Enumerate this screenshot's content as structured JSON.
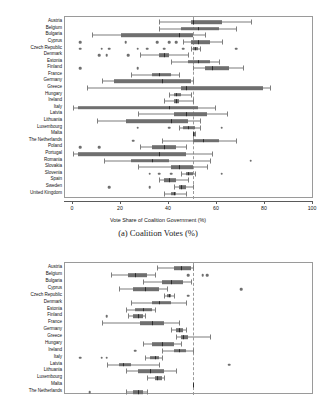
{
  "figure": {
    "top_partial_text": "",
    "panels": [
      {
        "id": "panel-a",
        "caption": "(a) Coalition Votes (%)",
        "xlabel": "Vote Share of Coalition Government (%)",
        "reference_line": 50
      },
      {
        "id": "panel-b",
        "caption": "",
        "xlabel": "",
        "reference_line": 50
      }
    ]
  },
  "chart_data": [
    {
      "type": "box",
      "id": "panel-a",
      "title": "(a) Coalition Votes (%)",
      "xlabel": "Vote Share of Coalition Government (%)",
      "ylabel": "",
      "xlim": [
        0,
        100
      ],
      "xticks": [
        0,
        20,
        40,
        60,
        80,
        100
      ],
      "xticklabels": [
        "0",
        "20",
        "40",
        "60",
        "80",
        "100"
      ],
      "grid": false,
      "legend": "none",
      "reference_line": 50,
      "categories": [
        "Austria",
        "Belgium",
        "Bulgaria",
        "Cyprus",
        "Czech Republic",
        "Denmark",
        "Estonia",
        "Finland",
        "France",
        "Germany",
        "Greece",
        "Hungary",
        "Ireland",
        "Italy",
        "Latvia",
        "Lithuania",
        "Luxembourg",
        "Malta",
        "The Netherlands",
        "Poland",
        "Portugal",
        "Romania",
        "Slovakia",
        "Slovenia",
        "Spain",
        "Sweden",
        "United Kingdom"
      ],
      "boxes": [
        {
          "category": "Austria",
          "whisker_low": 36,
          "q1": 49,
          "median": 50,
          "q3": 62,
          "whisker_high": 74,
          "outliers": []
        },
        {
          "category": "Belgium",
          "whisker_low": 36,
          "q1": 45,
          "median": 52,
          "q3": 61,
          "whisker_high": 68,
          "outliers": []
        },
        {
          "category": "Bulgaria",
          "whisker_low": 8,
          "q1": 20,
          "median": 44,
          "q3": 50,
          "whisker_high": 55,
          "outliers": []
        },
        {
          "category": "Cyprus",
          "whisker_low": 46,
          "q1": 49,
          "median": 52,
          "q3": 57,
          "whisker_high": 62,
          "outliers": [
            3,
            22,
            35,
            40,
            43
          ]
        },
        {
          "category": "Czech Republic",
          "whisker_low": 49,
          "q1": 50,
          "median": 51,
          "q3": 52,
          "whisker_high": 53,
          "outliers": [
            3,
            12,
            15,
            27,
            31,
            38,
            46,
            68
          ]
        },
        {
          "category": "Denmark",
          "whisker_low": 28,
          "q1": 36,
          "median": 38,
          "q3": 40,
          "whisker_high": 48,
          "outliers": [
            11,
            14,
            23
          ]
        },
        {
          "category": "Estonia",
          "whisker_low": 41,
          "q1": 48,
          "median": 52,
          "q3": 57,
          "whisker_high": 61,
          "outliers": []
        },
        {
          "category": "Finland",
          "whisker_low": 50,
          "q1": 55,
          "median": 58,
          "q3": 65,
          "whisker_high": 71,
          "outliers": [
            3,
            27
          ]
        },
        {
          "category": "France",
          "whisker_low": 24,
          "q1": 33,
          "median": 36,
          "q3": 41,
          "whisker_high": 44,
          "outliers": []
        },
        {
          "category": "Germany",
          "whisker_low": 12,
          "q1": 17,
          "median": 37,
          "q3": 49,
          "whisker_high": 50,
          "outliers": []
        },
        {
          "category": "Greece",
          "whisker_low": 6,
          "q1": 45,
          "median": 47,
          "q3": 79,
          "whisker_high": 82,
          "outliers": []
        },
        {
          "category": "Hungary",
          "whisker_low": 40,
          "q1": 42,
          "median": 43,
          "q3": 45,
          "whisker_high": 49,
          "outliers": []
        },
        {
          "category": "Ireland",
          "whisker_low": 38,
          "q1": 42,
          "median": 43,
          "q3": 44,
          "whisker_high": 50,
          "outliers": []
        },
        {
          "category": "Italy",
          "whisker_low": 0,
          "q1": 2,
          "median": 40,
          "q3": 52,
          "whisker_high": 59,
          "outliers": []
        },
        {
          "category": "Latvia",
          "whisker_low": 27,
          "q1": 42,
          "median": 47,
          "q3": 56,
          "whisker_high": 64,
          "outliers": []
        },
        {
          "category": "Lithuania",
          "whisker_low": 10,
          "q1": 22,
          "median": 41,
          "q3": 48,
          "whisker_high": 53,
          "outliers": []
        },
        {
          "category": "Luxembourg",
          "whisker_low": 44,
          "q1": 46,
          "median": 48,
          "q3": 51,
          "whisker_high": 53,
          "outliers": [
            27,
            40,
            62
          ]
        },
        {
          "category": "Malta",
          "whisker_low": 50,
          "q1": 50,
          "median": 50,
          "q3": 51,
          "whisker_high": 51,
          "outliers": []
        },
        {
          "category": "The Netherlands",
          "whisker_low": 37,
          "q1": 50,
          "median": 54,
          "q3": 61,
          "whisker_high": 68,
          "outliers": [
            25
          ]
        },
        {
          "category": "Poland",
          "whisker_low": 28,
          "q1": 33,
          "median": 38,
          "q3": 43,
          "whisker_high": 47,
          "outliers": [
            3,
            11
          ]
        },
        {
          "category": "Portugal",
          "whisker_low": 0,
          "q1": 2,
          "median": 36,
          "q3": 47,
          "whisker_high": 58,
          "outliers": []
        },
        {
          "category": "Romania",
          "whisker_low": 13,
          "q1": 24,
          "median": 33,
          "q3": 40,
          "whisker_high": 57,
          "outliers": [
            74
          ]
        },
        {
          "category": "Slovakia",
          "whisker_low": 27,
          "q1": 41,
          "median": 44,
          "q3": 50,
          "whisker_high": 56,
          "outliers": []
        },
        {
          "category": "Slovenia",
          "whisker_low": 45,
          "q1": 47,
          "median": 48,
          "q3": 50,
          "whisker_high": 51,
          "outliers": [
            32,
            36,
            41,
            62
          ]
        },
        {
          "category": "Spain",
          "whisker_low": 36,
          "q1": 38,
          "median": 40,
          "q3": 43,
          "whisker_high": 48,
          "outliers": []
        },
        {
          "category": "Sweden",
          "whisker_low": 42,
          "q1": 44,
          "median": 45,
          "q3": 47,
          "whisker_high": 50,
          "outliers": [
            15,
            32
          ]
        },
        {
          "category": "United Kingdom",
          "whisker_low": 38,
          "q1": 41,
          "median": 42,
          "q3": 43,
          "whisker_high": 47,
          "outliers": []
        }
      ]
    },
    {
      "type": "box",
      "id": "panel-b",
      "title": "",
      "xlabel": "",
      "ylabel": "",
      "xlim": [
        0,
        100
      ],
      "xticks": [
        0,
        20,
        40,
        60,
        80,
        100
      ],
      "xticklabels": [
        "0",
        "20",
        "40",
        "60",
        "80",
        "100"
      ],
      "grid": false,
      "legend": "none",
      "reference_line": 50,
      "note": "Panel is cropped at the bottom edge of the screenshot; only rows Austria through The Netherlands are visible.",
      "categories": [
        "Austria",
        "Belgium",
        "Bulgaria",
        "Cyprus",
        "Czech Republic",
        "Denmark",
        "Estonia",
        "Finland",
        "France",
        "Germany",
        "Greece",
        "Hungary",
        "Ireland",
        "Italy",
        "Latvia",
        "Lithuania",
        "Luxembourg",
        "Malta",
        "The Netherlands"
      ],
      "boxes": [
        {
          "category": "Austria",
          "whisker_low": 35,
          "q1": 42,
          "median": 45,
          "q3": 49,
          "whisker_high": 50,
          "outliers": []
        },
        {
          "category": "Belgium",
          "whisker_low": 16,
          "q1": 23,
          "median": 26,
          "q3": 31,
          "whisker_high": 34,
          "outliers": [
            48,
            54,
            56
          ]
        },
        {
          "category": "Bulgaria",
          "whisker_low": 29,
          "q1": 37,
          "median": 41,
          "q3": 46,
          "whisker_high": 49,
          "outliers": []
        },
        {
          "category": "Cyprus",
          "whisker_low": 19,
          "q1": 25,
          "median": 30,
          "q3": 36,
          "whisker_high": 39,
          "outliers": [
            70
          ]
        },
        {
          "category": "Czech Republic",
          "whisker_low": 38,
          "q1": 39,
          "median": 40,
          "q3": 41,
          "whisker_high": 42,
          "outliers": [
            48
          ]
        },
        {
          "category": "Denmark",
          "whisker_low": 24,
          "q1": 33,
          "median": 36,
          "q3": 41,
          "whisker_high": 47,
          "outliers": []
        },
        {
          "category": "Estonia",
          "whisker_low": 22,
          "q1": 26,
          "median": 29,
          "q3": 33,
          "whisker_high": 34,
          "outliers": []
        },
        {
          "category": "Finland",
          "whisker_low": 23,
          "q1": 25,
          "median": 27,
          "q3": 29,
          "whisker_high": 30,
          "outliers": [
            14
          ]
        },
        {
          "category": "France",
          "whisker_low": 12,
          "q1": 28,
          "median": 33,
          "q3": 38,
          "whisker_high": 44,
          "outliers": []
        },
        {
          "category": "Germany",
          "whisker_low": 41,
          "q1": 43,
          "median": 44,
          "q3": 46,
          "whisker_high": 47,
          "outliers": []
        },
        {
          "category": "Greece",
          "whisker_low": 43,
          "q1": 45,
          "median": 46,
          "q3": 48,
          "whisker_high": 57,
          "outliers": []
        },
        {
          "category": "Hungary",
          "whisker_low": 29,
          "q1": 33,
          "median": 37,
          "q3": 42,
          "whisker_high": 45,
          "outliers": []
        },
        {
          "category": "Ireland",
          "whisker_low": 37,
          "q1": 42,
          "median": 44,
          "q3": 47,
          "whisker_high": 50,
          "outliers": [
            26
          ]
        },
        {
          "category": "Italy",
          "whisker_low": 30,
          "q1": 32,
          "median": 34,
          "q3": 36,
          "whisker_high": 37,
          "outliers": [
            3,
            12,
            14
          ]
        },
        {
          "category": "Latvia",
          "whisker_low": 14,
          "q1": 19,
          "median": 21,
          "q3": 24,
          "whisker_high": 36,
          "outliers": [
            65
          ]
        },
        {
          "category": "Lithuania",
          "whisker_low": 22,
          "q1": 27,
          "median": 32,
          "q3": 38,
          "whisker_high": 43,
          "outliers": []
        },
        {
          "category": "Luxembourg",
          "whisker_low": 31,
          "q1": 34,
          "median": 35,
          "q3": 37,
          "whisker_high": 38,
          "outliers": []
        },
        {
          "category": "Malta",
          "whisker_low": 50,
          "q1": 50,
          "median": 50,
          "q3": 50,
          "whisker_high": 50,
          "outliers": []
        },
        {
          "category": "The Netherlands",
          "whisker_low": 22,
          "q1": 25,
          "median": 27,
          "q3": 29,
          "whisker_high": 31,
          "outliers": [
            7
          ]
        }
      ]
    }
  ]
}
